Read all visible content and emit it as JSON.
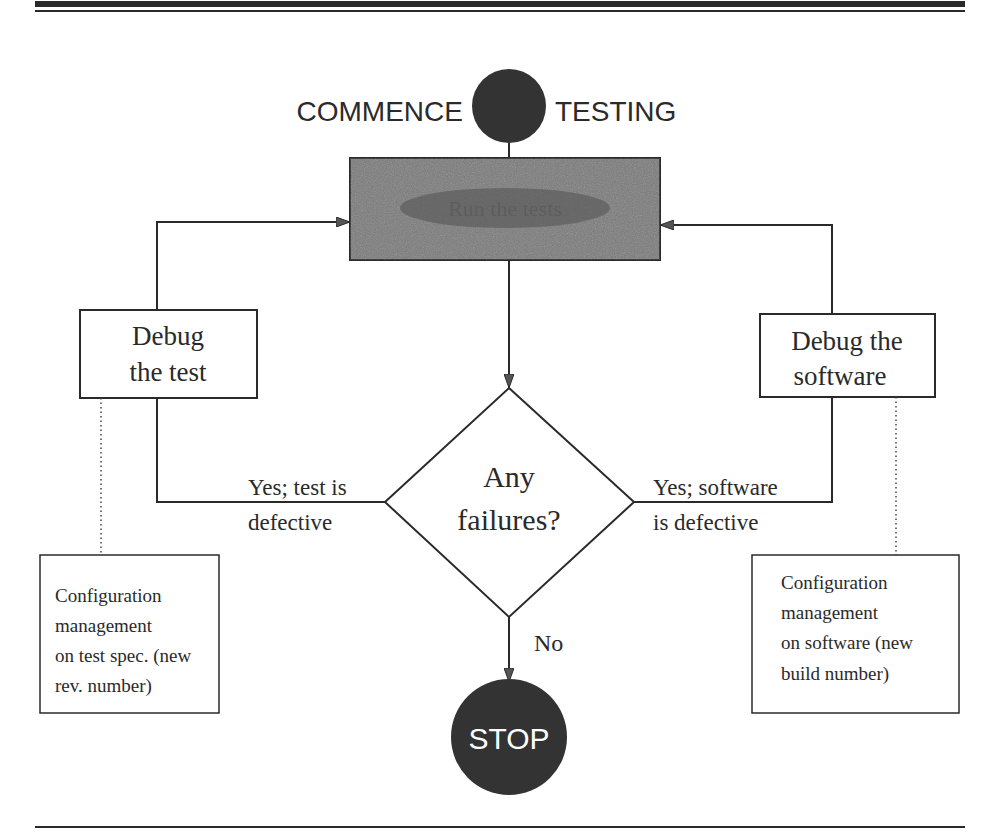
{
  "diagram": {
    "type": "flowchart",
    "start": {
      "label_left": "COMMENCE",
      "label_right": "TESTING"
    },
    "process": {
      "label": "Run the tests",
      "legible": false
    },
    "decision": {
      "line1": "Any",
      "line2": "failures?"
    },
    "left_branch": {
      "edge_line1": "Yes; test is",
      "edge_line2": "defective",
      "box_line1": "Debug",
      "box_line2": "the test",
      "note_lines": [
        "Configuration",
        "management",
        "on test spec. (new",
        "rev. number)"
      ]
    },
    "right_branch": {
      "edge_line1": "Yes; software",
      "edge_line2": "is defective",
      "box_line1": "Debug the",
      "box_line2": "software",
      "note_lines": [
        "Configuration",
        "management",
        "on software (new",
        "build number)"
      ]
    },
    "no_edge": "No",
    "end": {
      "label": "STOP"
    },
    "colors": {
      "ink": "#2a2a2a",
      "process_fill": "#7a7a7a",
      "terminal_fill": "#3a3a3a"
    }
  }
}
